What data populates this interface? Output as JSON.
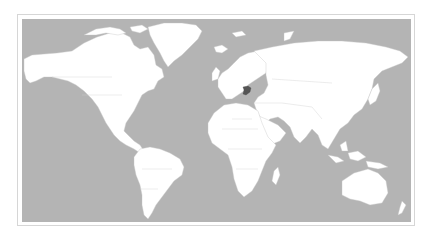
{
  "map": {
    "type": "world-political-outline",
    "projection": "equirectangular-like",
    "highlighted_country": "Syria",
    "colors": {
      "ocean": "#b4b4b4",
      "land": "#ffffff",
      "borders": "#cfcfcf",
      "highlight": "#555555",
      "frame": "#d6d6d6"
    }
  }
}
